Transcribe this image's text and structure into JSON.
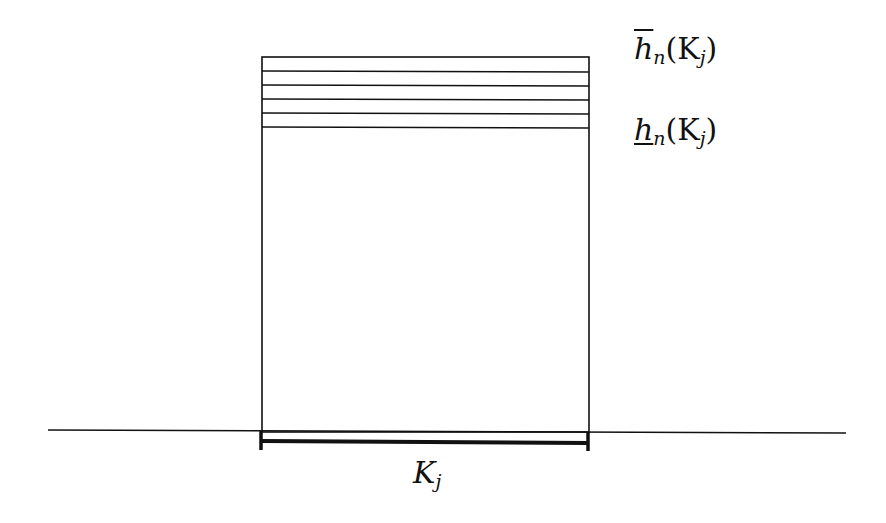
{
  "diagram": {
    "labels": {
      "upper": {
        "base": "h",
        "sub": "n",
        "arg": "(K",
        "argsub": "j",
        "close": ")",
        "decoration": "overline"
      },
      "lower": {
        "base": "h",
        "sub": "n",
        "arg": "(K",
        "argsub": "j",
        "close": ")",
        "decoration": "underline"
      },
      "interval": {
        "base": "K",
        "sub": "j"
      }
    },
    "stripe_count": 5,
    "colors": {
      "stroke": "#111111",
      "background": "#ffffff"
    }
  }
}
